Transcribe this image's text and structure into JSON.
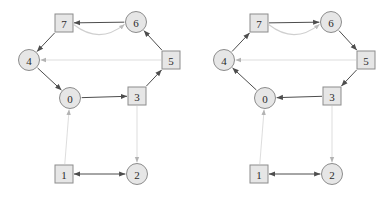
{
  "figure": {
    "background_color": "#ffffff",
    "panel_count": 2,
    "node_fill": "#e6e6e6",
    "node_stroke": "#8c8c8c",
    "label_color": "#2b2b2b",
    "edge_color_solid": "#4d4d4d",
    "edge_color_faint": "#d9d9d9",
    "edge_color_curve": "#cfcfcf"
  },
  "panels": [
    {
      "id": "left-graph",
      "name": "left-graph",
      "nodes": [
        {
          "id": "0",
          "label": "0",
          "shape": "circle",
          "x": 70,
          "y": 98
        },
        {
          "id": "1",
          "label": "1",
          "shape": "square",
          "x": 64,
          "y": 174
        },
        {
          "id": "2",
          "label": "2",
          "shape": "circle",
          "x": 137,
          "y": 174
        },
        {
          "id": "3",
          "label": "3",
          "shape": "square",
          "x": 137,
          "y": 96
        },
        {
          "id": "4",
          "label": "4",
          "shape": "circle",
          "x": 29,
          "y": 60
        },
        {
          "id": "5",
          "label": "5",
          "shape": "square",
          "x": 171,
          "y": 60
        },
        {
          "id": "6",
          "label": "6",
          "shape": "circle",
          "x": 136,
          "y": 22
        },
        {
          "id": "7",
          "label": "7",
          "shape": "square",
          "x": 64,
          "y": 23
        }
      ],
      "edges": [
        {
          "from": "6",
          "to": "7",
          "style": "solid",
          "kind": "straight",
          "arrow": "end"
        },
        {
          "from": "7",
          "to": "6",
          "style": "curve",
          "kind": "curved",
          "arrow": "end"
        },
        {
          "from": "7",
          "to": "4",
          "style": "solid",
          "kind": "straight",
          "arrow": "end"
        },
        {
          "from": "5",
          "to": "4",
          "style": "faint",
          "kind": "straight",
          "arrow": "end"
        },
        {
          "from": "5",
          "to": "6",
          "style": "solid",
          "kind": "straight",
          "arrow": "end"
        },
        {
          "from": "3",
          "to": "5",
          "style": "solid",
          "kind": "straight",
          "arrow": "end"
        },
        {
          "from": "4",
          "to": "0",
          "style": "solid",
          "kind": "straight",
          "arrow": "end"
        },
        {
          "from": "0",
          "to": "3",
          "style": "solid",
          "kind": "straight",
          "arrow": "end"
        },
        {
          "from": "1",
          "to": "0",
          "style": "faint",
          "kind": "straight",
          "arrow": "end"
        },
        {
          "from": "3",
          "to": "2",
          "style": "faint",
          "kind": "straight",
          "arrow": "end"
        },
        {
          "from": "1",
          "to": "2",
          "style": "solid",
          "kind": "straight",
          "arrow": "both"
        }
      ]
    },
    {
      "id": "right-graph",
      "name": "right-graph",
      "nodes": [
        {
          "id": "0",
          "label": "0",
          "shape": "circle",
          "x": 265,
          "y": 98
        },
        {
          "id": "1",
          "label": "1",
          "shape": "square",
          "x": 259,
          "y": 174
        },
        {
          "id": "2",
          "label": "2",
          "shape": "circle",
          "x": 332,
          "y": 174
        },
        {
          "id": "3",
          "label": "3",
          "shape": "square",
          "x": 332,
          "y": 96
        },
        {
          "id": "4",
          "label": "4",
          "shape": "circle",
          "x": 224,
          "y": 60
        },
        {
          "id": "5",
          "label": "5",
          "shape": "square",
          "x": 366,
          "y": 60
        },
        {
          "id": "6",
          "label": "6",
          "shape": "circle",
          "x": 331,
          "y": 22
        },
        {
          "id": "7",
          "label": "7",
          "shape": "square",
          "x": 259,
          "y": 23
        }
      ],
      "edges": [
        {
          "from": "7",
          "to": "6",
          "style": "solid",
          "kind": "straight",
          "arrow": "end"
        },
        {
          "from": "7",
          "to": "6",
          "style": "curve",
          "kind": "curved",
          "arrow": "end"
        },
        {
          "from": "4",
          "to": "7",
          "style": "solid",
          "kind": "straight",
          "arrow": "end"
        },
        {
          "from": "5",
          "to": "4",
          "style": "faint",
          "kind": "straight",
          "arrow": "end"
        },
        {
          "from": "6",
          "to": "5",
          "style": "solid",
          "kind": "straight",
          "arrow": "end"
        },
        {
          "from": "5",
          "to": "3",
          "style": "solid",
          "kind": "straight",
          "arrow": "end"
        },
        {
          "from": "0",
          "to": "4",
          "style": "solid",
          "kind": "straight",
          "arrow": "end"
        },
        {
          "from": "3",
          "to": "0",
          "style": "solid",
          "kind": "straight",
          "arrow": "end"
        },
        {
          "from": "1",
          "to": "0",
          "style": "faint",
          "kind": "straight",
          "arrow": "end"
        },
        {
          "from": "3",
          "to": "2",
          "style": "faint",
          "kind": "straight",
          "arrow": "end"
        },
        {
          "from": "1",
          "to": "2",
          "style": "solid",
          "kind": "straight",
          "arrow": "both"
        }
      ]
    }
  ]
}
